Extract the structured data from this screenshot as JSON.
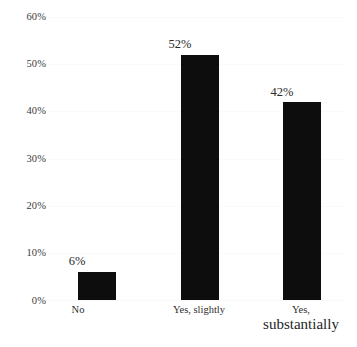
{
  "chart_data": {
    "type": "bar",
    "title": "",
    "subtitle": "",
    "xlabel": "",
    "ylabel": "",
    "categories": [
      "No",
      "Yes, slightly",
      "Yes, substantially"
    ],
    "category_lines": [
      [
        "No"
      ],
      [
        "Yes, slightly"
      ],
      [
        "Yes,",
        "substantially"
      ]
    ],
    "values": [
      6,
      52,
      42
    ],
    "value_labels": [
      "6%",
      "52%",
      "42%"
    ],
    "ylim": [
      0,
      60
    ],
    "ytick_values": [
      0,
      10,
      20,
      30,
      40,
      50,
      60
    ],
    "ytick_labels": [
      "0%",
      "10%",
      "20%",
      "30%",
      "40%",
      "50%",
      "60%"
    ],
    "grid": true,
    "legend": false,
    "legend_position": "none",
    "bar_color": "#0d0d0d",
    "gridline_color": "#fafafa",
    "axis_text_color": "#3c3c3c"
  }
}
